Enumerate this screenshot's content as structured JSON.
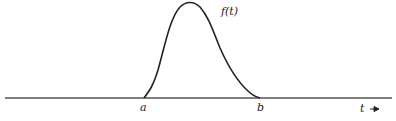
{
  "figure": {
    "curve_label": "f(t)",
    "point_a_label": "a",
    "point_b_label": "b",
    "axis_label": "t",
    "axis_arrow": "→"
  },
  "colors": {
    "line": "#222222",
    "axis": "#555555",
    "background": "#ffffff"
  }
}
